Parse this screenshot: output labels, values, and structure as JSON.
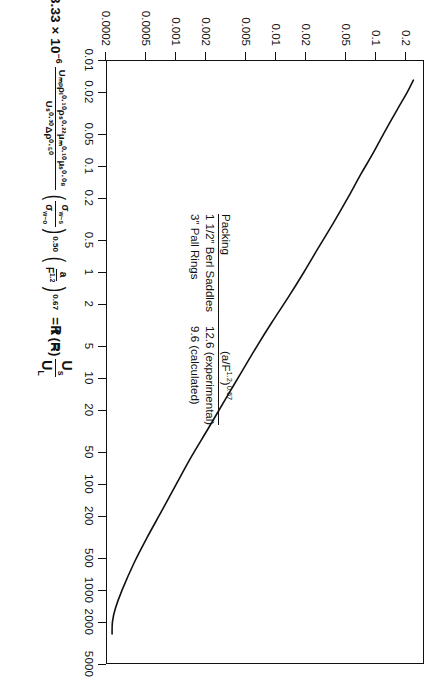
{
  "figure": {
    "kind": "log-log-line-chart",
    "orientation_note": "page is the chart rotated 90 degrees clockwise"
  },
  "xaxis": {
    "title_lead": "R",
    "title_equals": "=",
    "title_num": "U",
    "title_num_sub": "s",
    "title_den": "U",
    "title_den_sub": "L",
    "ticks": [
      "0.01",
      "0.02",
      "0.05",
      "0.1",
      "0.2",
      "0.5",
      "1",
      "2",
      "5",
      "10",
      "20",
      "50",
      "100",
      "200",
      "500",
      "1000",
      "2000",
      "5000"
    ]
  },
  "yaxis": {
    "ticks": [
      "0.2",
      "0.1",
      "0.05",
      "0.02",
      "0.01",
      "0.005",
      "0.002",
      "0.001",
      "0.0005",
      "0.0002"
    ],
    "title_lead": "3.33 × 10",
    "title_lead_sup": "−6",
    "title_frac_num": "Uₘₚρₗ⁰·¹⁰ρₛ⁰·²²μₘ⁰·¹⁰μₛ⁰·⁰⁸",
    "title_frac_den": "Uₛ⁰·³⁰Δρ⁰·⁵⁰",
    "title_p1_num": "σ_{w−s}",
    "title_p1_den": "σ_{w−o}",
    "title_p1_exp": "0.50",
    "title_p2_num": "a",
    "title_p2_den": "F¹·²",
    "title_p2_exp": "0.67",
    "title_tail": "= f (R)"
  },
  "legend": {
    "header_packing": "Packing",
    "header_value_num": "(a/F",
    "header_value_num_sup": "1.2",
    "header_value_num_close": ")",
    "header_value_sup2": "0.67",
    "rows": [
      {
        "packing": "1 1/2″ Berl Saddles",
        "value": "12.6 (experimental)"
      },
      {
        "packing": "3″ Pall Rings",
        "value": "9.6 (calculated)"
      }
    ]
  },
  "chart_data": {
    "type": "line",
    "title": "",
    "xlabel": "R = Us / UL",
    "ylabel": "3.33 × 10^-6 · (Uwp ρw^0.10 ρs^0.22 μw^0.10 μs^0.08) / (Us^0.30 Δρ^0.50) · (σw-s/σw-o)^0.50 · (a/F^1.2)^0.67 = f(R)",
    "xscale": "log",
    "yscale": "log",
    "xlim": [
      0.01,
      5000
    ],
    "ylim": [
      0.0002,
      0.3
    ],
    "grid": false,
    "legend_position": "inside-center",
    "xticks": [
      0.01,
      0.02,
      0.05,
      0.1,
      0.2,
      0.5,
      1,
      2,
      5,
      10,
      20,
      50,
      100,
      200,
      500,
      1000,
      2000,
      5000
    ],
    "yticks": [
      0.2,
      0.1,
      0.05,
      0.02,
      0.01,
      0.005,
      0.002,
      0.001,
      0.0005,
      0.0002
    ],
    "series": [
      {
        "name": "f(R)",
        "x": [
          0.0155,
          0.02,
          0.03,
          0.05,
          0.08,
          0.12,
          0.2,
          0.35,
          0.6,
          1.0,
          1.7,
          3.0,
          5.0,
          9.0,
          16,
          30,
          55,
          100,
          180,
          320,
          560,
          1000,
          1500,
          2000,
          2600
        ],
        "y": [
          0.235,
          0.205,
          0.16,
          0.118,
          0.09,
          0.07,
          0.052,
          0.037,
          0.0262,
          0.019,
          0.0134,
          0.00905,
          0.00645,
          0.00445,
          0.0031,
          0.0021,
          0.00143,
          0.00101,
          0.00072,
          0.000515,
          0.00038,
          0.00029,
          0.000248,
          0.000232,
          0.00023
        ]
      }
    ]
  }
}
